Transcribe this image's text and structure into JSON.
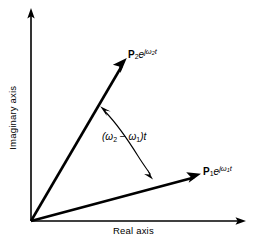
{
  "figure": {
    "background_color": "#ffffff",
    "stroke_color": "#000000",
    "width": 260,
    "height": 246
  },
  "axes": {
    "imaginary": {
      "label": "Imaginary axis",
      "orientation": "vertical",
      "arrow": "up"
    },
    "real": {
      "label": "Real axis",
      "orientation": "horizontal",
      "arrow": "right"
    },
    "origin": {
      "x": 31,
      "y": 221
    }
  },
  "vectors": [
    {
      "name": "phasor-2",
      "label_plain": "P2 e^{j omega_2 t}",
      "symbol": "P",
      "subscript": "2",
      "exponent_prefix": "e",
      "exponent_j": "j",
      "exponent_omega": "ω",
      "exponent_subscript": "2",
      "exponent_t": "t",
      "tip": {
        "x": 126,
        "y": 60
      },
      "angle_degrees": 59.5
    },
    {
      "name": "phasor-1",
      "label_plain": "P1 e^{j omega_1 t}",
      "symbol": "P",
      "subscript": "1",
      "exponent_prefix": "e",
      "exponent_j": "j",
      "exponent_omega": "ω",
      "exponent_subscript": "1",
      "exponent_t": "t",
      "tip": {
        "x": 200,
        "y": 174
      },
      "angle_degrees": 16.4
    }
  ],
  "annotation": {
    "name": "angle-between-phasors",
    "open_paren": "(",
    "omega2": "ω",
    "omega2_sub": "2",
    "minus": "−",
    "omega1": "ω",
    "omega1_sub": "1",
    "close_paren": ")",
    "t": "t",
    "label_plain": "(ω2 − ω1)t",
    "arc": {
      "double_headed": true,
      "head_upper": {
        "x": 101,
        "y": 107
      },
      "head_lower": {
        "x": 152,
        "y": 177
      }
    }
  }
}
